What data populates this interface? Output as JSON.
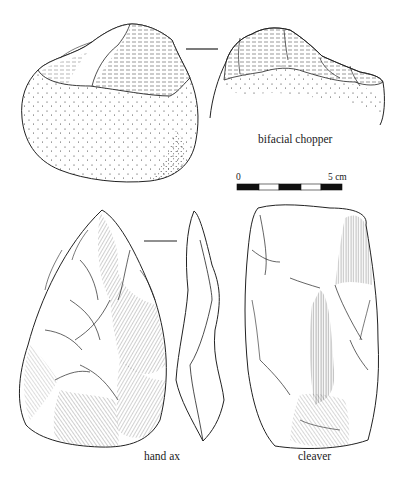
{
  "figure": {
    "artifacts": [
      {
        "id": "bifacial-chopper",
        "label": "bifacial chopper"
      },
      {
        "id": "hand-ax",
        "label": "hand ax"
      },
      {
        "id": "cleaver",
        "label": "cleaver"
      }
    ],
    "scale_bar": {
      "start_label": "0",
      "end_label": "5 cm",
      "segments": 5,
      "colors": [
        "#111111",
        "#ffffff",
        "#111111",
        "#ffffff",
        "#111111"
      ]
    },
    "line_color": "#222222",
    "background": "#ffffff"
  }
}
